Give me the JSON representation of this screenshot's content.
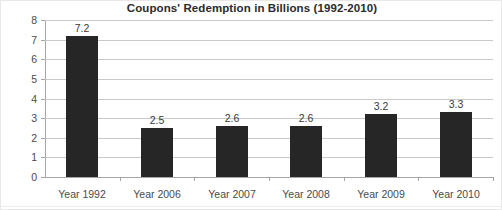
{
  "chart_data": {
    "type": "bar",
    "title": "Coupons' Redemption in Billions (1992-2010)",
    "xlabel": "",
    "ylabel": "",
    "categories": [
      "Year 1992",
      "Year 2006",
      "Year 2007",
      "Year 2008",
      "Year 2009",
      "Year 2010"
    ],
    "values": [
      7.2,
      2.5,
      2.6,
      2.6,
      3.2,
      3.3
    ],
    "value_labels": [
      "7.2",
      "2.5",
      "2.6",
      "2.6",
      "3.2",
      "3.3"
    ],
    "ylim": [
      0,
      8
    ],
    "y_ticks": [
      0,
      1,
      2,
      3,
      4,
      5,
      6,
      7,
      8
    ],
    "y_tick_labels": [
      "0",
      "1",
      "2",
      "3",
      "4",
      "5",
      "6",
      "7",
      "8"
    ],
    "grid": "horizontal",
    "legend": "none",
    "bar_color": "#262626",
    "gridline_color": "#c9c9c9",
    "axis_color": "#a6a6a6",
    "background_color": "#ffffff",
    "title_color": "#2b2b2b",
    "tick_label_color": "#4a4a4a",
    "data_label_color": "#3a3a3a"
  }
}
